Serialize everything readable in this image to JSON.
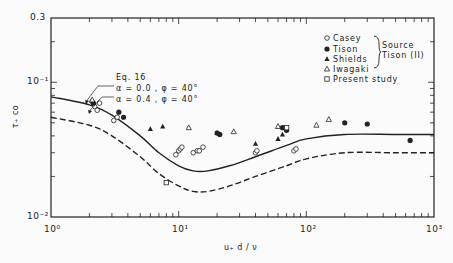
{
  "chart_data": {
    "type": "scatter",
    "title": "",
    "xlabel": "u*d / ν",
    "ylabel": "τ*co",
    "xscale": "log",
    "yscale": "log",
    "xlim": [
      1,
      1000
    ],
    "ylim": [
      0.01,
      0.3
    ],
    "x_tick_labels": [
      "10⁰",
      "10¹",
      "10²",
      "10³"
    ],
    "y_tick_labels": [
      "10⁻²",
      "10⁻¹",
      "0.3"
    ],
    "grid": false,
    "legend_position": "upper right",
    "legend": [
      {
        "marker": "open-circle",
        "label": "Casey"
      },
      {
        "marker": "filled-circle",
        "label": "Tison"
      },
      {
        "marker": "filled-triangle",
        "label": "Shields"
      },
      {
        "marker": "open-triangle",
        "label": "Iwagaki"
      },
      {
        "marker": "open-square",
        "label": "Present study"
      }
    ],
    "legend_bracket_note": [
      "Source",
      "Tison (II)"
    ],
    "annotations": [
      {
        "text": "Eq. 16"
      },
      {
        "text": "α = 0.0 , φ = 40°",
        "points_to": "solid curve"
      },
      {
        "text": "α = 0.4 , φ = 40°",
        "points_to": "dashed curve"
      }
    ],
    "series": [
      {
        "name": "α = 0.0, φ = 40° (Eq. 16)",
        "style": "solid",
        "x": [
          1,
          2,
          3,
          5,
          7,
          10,
          13,
          17,
          25,
          40,
          70,
          100,
          200,
          500,
          1000
        ],
        "y": [
          0.078,
          0.068,
          0.057,
          0.04,
          0.03,
          0.024,
          0.022,
          0.022,
          0.024,
          0.028,
          0.034,
          0.038,
          0.041,
          0.041,
          0.041
        ]
      },
      {
        "name": "α = 0.4, φ = 40°",
        "style": "dashed",
        "x": [
          1,
          2,
          3,
          5,
          7,
          10,
          13,
          17,
          25,
          40,
          70,
          100,
          200,
          500,
          1000
        ],
        "y": [
          0.055,
          0.048,
          0.04,
          0.028,
          0.021,
          0.017,
          0.0155,
          0.0155,
          0.017,
          0.02,
          0.024,
          0.027,
          0.03,
          0.03,
          0.03
        ]
      },
      {
        "name": "Casey",
        "marker": "open-circle",
        "x": [
          2.1,
          2.2,
          2.3,
          2.4,
          3.1,
          3.3,
          9.5,
          10,
          10.3,
          10.6,
          13,
          14,
          14.5,
          15.5,
          40,
          41,
          80,
          83
        ],
        "y": [
          0.072,
          0.066,
          0.062,
          0.07,
          0.052,
          0.055,
          0.029,
          0.031,
          0.032,
          0.033,
          0.03,
          0.031,
          0.031,
          0.033,
          0.03,
          0.031,
          0.031,
          0.032
        ]
      },
      {
        "name": "Tison",
        "marker": "filled-circle",
        "x": [
          2.15,
          3.4,
          3.7,
          20,
          21,
          65,
          70,
          200,
          300,
          650
        ],
        "y": [
          0.07,
          0.06,
          0.055,
          0.042,
          0.041,
          0.046,
          0.044,
          0.05,
          0.049,
          0.037
        ]
      },
      {
        "name": "Shields",
        "marker": "filled-triangle",
        "x": [
          2.1,
          6,
          7.5,
          20,
          40,
          60,
          65
        ],
        "y": [
          0.073,
          0.045,
          0.047,
          0.042,
          0.035,
          0.038,
          0.041
        ]
      },
      {
        "name": "Iwagaki",
        "marker": "open-triangle",
        "x": [
          2.1,
          12,
          27,
          60,
          120,
          150
        ],
        "y": [
          0.074,
          0.046,
          0.043,
          0.047,
          0.048,
          0.053
        ]
      },
      {
        "name": "Present study",
        "marker": "open-square",
        "x": [
          8,
          70
        ],
        "y": [
          0.018,
          0.046
        ]
      }
    ]
  },
  "axes": {
    "xlabel": "u₊ d / ν",
    "ylabel": "τ₊ co",
    "xticks": [
      {
        "label": "10⁰",
        "value": 1
      },
      {
        "label": "10¹",
        "value": 10
      },
      {
        "label": "10²",
        "value": 100
      },
      {
        "label": "10³",
        "value": 1000
      }
    ],
    "yticks": [
      {
        "label": "0.3",
        "value": 0.3
      },
      {
        "label": "10⁻¹",
        "value": 0.1
      },
      {
        "label": "10⁻²",
        "value": 0.01
      }
    ]
  },
  "annotation_text": {
    "eq": "Eq. 16",
    "a0": "α = 0.0 , φ = 40°",
    "a4": "α = 0.4 , φ = 40°"
  },
  "legend": {
    "items": [
      "Casey",
      "Tison",
      "Shields",
      "Iwagaki",
      "Present study"
    ],
    "source_line1": "Source",
    "source_line2": "Tison (II)"
  }
}
